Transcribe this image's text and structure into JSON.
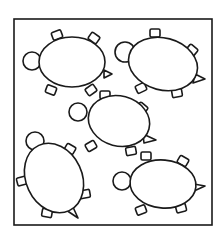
{
  "image": {
    "description": "Line drawing of five turtles inside a square frame",
    "stroke_color": "#1a1a1a",
    "background": "#ffffff",
    "frame": {
      "x": 14,
      "y": 19,
      "width": 198,
      "height": 206
    }
  },
  "turtles": [
    {
      "id": 1,
      "body": {
        "cx": 72,
        "cy": 62,
        "rx": 33,
        "ry": 25,
        "rot": 0
      },
      "head": {
        "cx": 32,
        "cy": 61,
        "r": 9
      },
      "feet": [
        [
          57,
          35,
          -20
        ],
        [
          94,
          38,
          35
        ],
        [
          51,
          90,
          20
        ],
        [
          91,
          90,
          -35
        ]
      ],
      "tail": [
        [
          104,
          70
        ],
        [
          112,
          74
        ],
        [
          104,
          78
        ]
      ]
    },
    {
      "id": 2,
      "body": {
        "cx": 163,
        "cy": 64,
        "rx": 35,
        "ry": 26,
        "rot": 15
      },
      "head": {
        "cx": 125,
        "cy": 52,
        "r": 10
      },
      "feet": [
        [
          155,
          33,
          0
        ],
        [
          192,
          50,
          40
        ],
        [
          141,
          88,
          -25
        ],
        [
          177,
          93,
          -10
        ]
      ],
      "tail": [
        [
          195,
          74
        ],
        [
          205,
          79
        ],
        [
          193,
          83
        ]
      ]
    },
    {
      "id": 3,
      "body": {
        "cx": 119,
        "cy": 121,
        "rx": 31,
        "ry": 25,
        "rot": 15
      },
      "head": {
        "cx": 78,
        "cy": 112,
        "r": 9
      },
      "feet": [
        [
          105,
          95,
          0
        ],
        [
          142,
          108,
          40
        ],
        [
          91,
          146,
          -30
        ],
        [
          131,
          151,
          -10
        ]
      ],
      "tail": [
        [
          143,
          134
        ],
        [
          156,
          140
        ],
        [
          144,
          143
        ]
      ]
    },
    {
      "id": 4,
      "body": {
        "cx": 54,
        "cy": 178,
        "rx": 28,
        "ry": 36,
        "rot": -25
      },
      "head": {
        "cx": 35,
        "cy": 141,
        "r": 9
      },
      "feet": [
        [
          70,
          149,
          30
        ],
        [
          22,
          181,
          -15
        ],
        [
          85,
          194,
          -10
        ],
        [
          47,
          213,
          10
        ]
      ],
      "tail": [
        [
          72,
          205
        ],
        [
          78,
          218
        ],
        [
          66,
          210
        ]
      ]
    },
    {
      "id": 5,
      "body": {
        "cx": 163,
        "cy": 184,
        "rx": 33,
        "ry": 24,
        "rot": 5
      },
      "head": {
        "cx": 122,
        "cy": 181,
        "r": 9
      },
      "feet": [
        [
          146,
          156,
          0
        ],
        [
          183,
          161,
          30
        ],
        [
          141,
          210,
          -20
        ],
        [
          181,
          208,
          -15
        ]
      ],
      "tail": [
        [
          194,
          184
        ],
        [
          205,
          186
        ],
        [
          194,
          191
        ]
      ]
    }
  ]
}
